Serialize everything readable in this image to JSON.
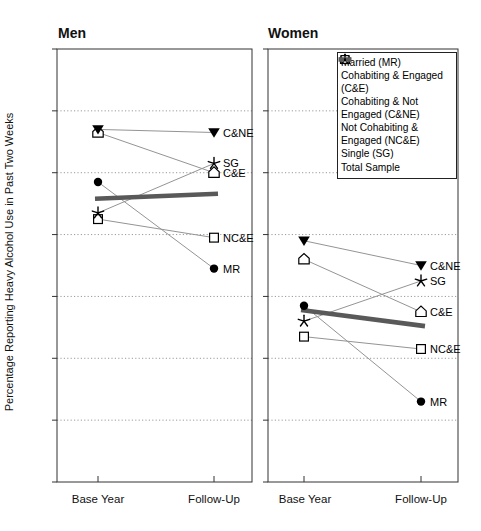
{
  "figure": {
    "background": "#ffffff",
    "colors": {
      "ink": "#000000",
      "thin_line": "#949494",
      "total_line": "#595959",
      "grid": "#9a9a9a",
      "border": "#333333"
    }
  },
  "chart_data": {
    "type": "line",
    "x_categories": [
      "Base Year",
      "Follow-Up"
    ],
    "ylabel": "Percentage Reporting Heavy Alcohol Use in Past Two Weeks",
    "ylim": [
      0,
      70
    ],
    "yticks": [
      0,
      10,
      20,
      30,
      40,
      50,
      60,
      70
    ],
    "grid": {
      "horizontal_dotted_at": [
        10,
        20,
        30,
        40,
        50,
        60
      ]
    },
    "legend_position": "top-right",
    "series_meta": [
      {
        "key": "MR",
        "label": "Married (MR)",
        "marker": "filled-circle"
      },
      {
        "key": "CE",
        "label": "Cohabiting & Engaged (C&E)",
        "marker": "open-pentagon"
      },
      {
        "key": "CNE",
        "label": "Cohabiting & Not Engaged (C&NE)",
        "marker": "filled-triangle-down"
      },
      {
        "key": "NCE",
        "label": "Not Cohabiting & Engaged (NC&E)",
        "marker": "open-square"
      },
      {
        "key": "SG",
        "label": "Single (SG)",
        "marker": "star"
      },
      {
        "key": "TOTAL",
        "label": "Total Sample",
        "marker": "thick-gray-line"
      }
    ],
    "panels": [
      {
        "title": "Men",
        "series": [
          {
            "key": "MR",
            "annotation": "MR",
            "values": [
              48.5,
              34.5
            ]
          },
          {
            "key": "CE",
            "annotation": "C&E",
            "values": [
              56.5,
              50.0
            ]
          },
          {
            "key": "CNE",
            "annotation": "C&NE",
            "values": [
              57.0,
              56.5
            ]
          },
          {
            "key": "NCE",
            "annotation": "NC&E",
            "values": [
              42.5,
              39.5
            ]
          },
          {
            "key": "SG",
            "annotation": "SG",
            "values": [
              43.5,
              51.5
            ]
          },
          {
            "key": "TOTAL",
            "annotation": "",
            "values": [
              45.8,
              46.6
            ]
          }
        ]
      },
      {
        "title": "Women",
        "series": [
          {
            "key": "MR",
            "annotation": "MR",
            "values": [
              28.5,
              13.0
            ]
          },
          {
            "key": "CE",
            "annotation": "C&E",
            "values": [
              36.0,
              27.5
            ]
          },
          {
            "key": "CNE",
            "annotation": "C&NE",
            "values": [
              39.0,
              35.0
            ]
          },
          {
            "key": "NCE",
            "annotation": "NC&E",
            "values": [
              23.5,
              21.5
            ]
          },
          {
            "key": "SG",
            "annotation": "SG",
            "values": [
              26.0,
              32.5
            ]
          },
          {
            "key": "TOTAL",
            "annotation": "",
            "values": [
              27.8,
              25.2
            ]
          }
        ]
      }
    ]
  }
}
